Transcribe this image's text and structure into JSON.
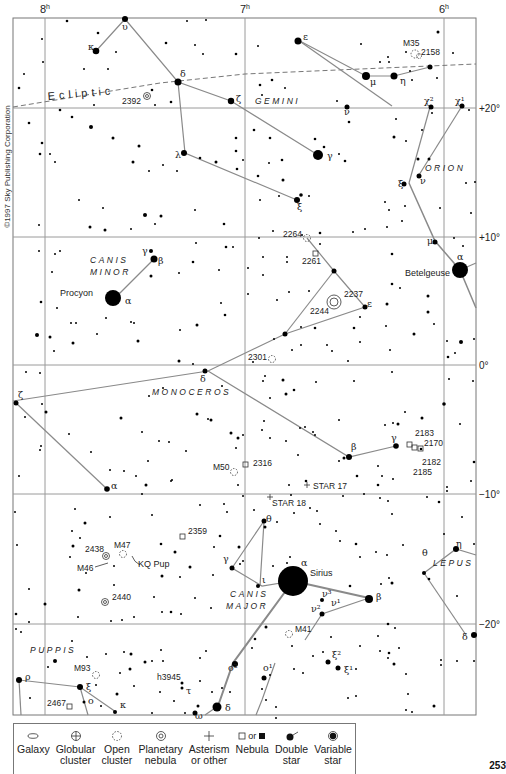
{
  "copyright": "©1997 Sky Publishing Corporation",
  "page_number": "253",
  "ra_labels": [
    {
      "label": "8",
      "sup": "h",
      "x": 45
    },
    {
      "label": "7",
      "sup": "h",
      "x": 245
    },
    {
      "label": "6",
      "sup": "h",
      "x": 444
    }
  ],
  "dec_labels": [
    {
      "label": "+20°",
      "y": 108
    },
    {
      "label": "+10°",
      "y": 237
    },
    {
      "label": "0°",
      "y": 365
    },
    {
      "label": "−10°",
      "y": 494
    },
    {
      "label": "−20°",
      "y": 624
    }
  ],
  "ecliptic_label": "Ecliptic",
  "constellations": [
    {
      "name": "GEMINI",
      "x": 255,
      "y": 104
    },
    {
      "name": "ORION",
      "x": 425,
      "y": 171
    },
    {
      "name": "CANIS",
      "x": 90,
      "y": 263
    },
    {
      "name": "MINOR",
      "x": 90,
      "y": 275
    },
    {
      "name": "MONOCEROS",
      "x": 152,
      "y": 395
    },
    {
      "name": "LEPUS",
      "x": 433,
      "y": 566
    },
    {
      "name": "CANIS",
      "x": 230,
      "y": 597
    },
    {
      "name": "MAJOR",
      "x": 226,
      "y": 609
    },
    {
      "name": "PUPPIS",
      "x": 30,
      "y": 653
    }
  ],
  "star_names": [
    {
      "name": "Procyon",
      "x": 60,
      "y": 296
    },
    {
      "name": "Betelgeuse",
      "x": 405,
      "y": 276
    },
    {
      "name": "Sirius",
      "x": 310,
      "y": 576
    },
    {
      "name": "KQ Pup",
      "x": 138,
      "y": 567
    }
  ],
  "objects": [
    {
      "label": "M35",
      "x": 403,
      "y": 46
    },
    {
      "label": "2158",
      "x": 421,
      "y": 55
    },
    {
      "label": "2392",
      "x": 122,
      "y": 104
    },
    {
      "label": "2264",
      "x": 283,
      "y": 237
    },
    {
      "label": "2261",
      "x": 302,
      "y": 264
    },
    {
      "label": "2237",
      "x": 344,
      "y": 297
    },
    {
      "label": "2244",
      "x": 310,
      "y": 314
    },
    {
      "label": "2301",
      "x": 248,
      "y": 360
    },
    {
      "label": "2183",
      "x": 415,
      "y": 436
    },
    {
      "label": "2170",
      "x": 424,
      "y": 446
    },
    {
      "label": "2182",
      "x": 422,
      "y": 465
    },
    {
      "label": "2185",
      "x": 413,
      "y": 475
    },
    {
      "label": "M50",
      "x": 213,
      "y": 470
    },
    {
      "label": "2316",
      "x": 253,
      "y": 466
    },
    {
      "label": "STAR 17",
      "x": 313,
      "y": 489
    },
    {
      "label": "STAR 18",
      "x": 272,
      "y": 506
    },
    {
      "label": "2359",
      "x": 188,
      "y": 534
    },
    {
      "label": "2438",
      "x": 85,
      "y": 552
    },
    {
      "label": "M47",
      "x": 114,
      "y": 548
    },
    {
      "label": "M46",
      "x": 77,
      "y": 571
    },
    {
      "label": "2440",
      "x": 112,
      "y": 600
    },
    {
      "label": "M41",
      "x": 295,
      "y": 632
    },
    {
      "label": "M93",
      "x": 74,
      "y": 671
    },
    {
      "label": "h3945",
      "x": 157,
      "y": 680
    },
    {
      "label": "2467",
      "x": 47,
      "y": 706
    }
  ],
  "greek_labels": [
    {
      "t": "υ",
      "x": 122,
      "y": 30
    },
    {
      "t": "κ",
      "x": 88,
      "y": 50
    },
    {
      "t": "ε",
      "x": 303,
      "y": 40
    },
    {
      "t": "δ",
      "x": 180,
      "y": 77
    },
    {
      "t": "ζ",
      "x": 236,
      "y": 102
    },
    {
      "t": "μ",
      "x": 370,
      "y": 85
    },
    {
      "t": "η",
      "x": 400,
      "y": 84
    },
    {
      "t": "ν",
      "x": 344,
      "y": 115
    },
    {
      "t": "χ²",
      "x": 424,
      "y": 104
    },
    {
      "t": "χ¹",
      "x": 455,
      "y": 104
    },
    {
      "t": "γ",
      "x": 327,
      "y": 159
    },
    {
      "t": "λ",
      "x": 175,
      "y": 158
    },
    {
      "t": "ξ",
      "x": 297,
      "y": 210
    },
    {
      "t": "ξ",
      "x": 398,
      "y": 187
    },
    {
      "t": "ν",
      "x": 420,
      "y": 184
    },
    {
      "t": "μ",
      "x": 427,
      "y": 244
    },
    {
      "t": "α",
      "x": 457,
      "y": 260
    },
    {
      "t": "γ",
      "x": 142,
      "y": 254
    },
    {
      "t": "β",
      "x": 158,
      "y": 264
    },
    {
      "t": "α",
      "x": 125,
      "y": 304
    },
    {
      "t": "ε",
      "x": 367,
      "y": 307
    },
    {
      "t": "δ",
      "x": 200,
      "y": 382
    },
    {
      "t": "ζ",
      "x": 18,
      "y": 398
    },
    {
      "t": "β",
      "x": 351,
      "y": 450
    },
    {
      "t": "γ",
      "x": 391,
      "y": 441
    },
    {
      "t": "α",
      "x": 111,
      "y": 489
    },
    {
      "t": "θ",
      "x": 266,
      "y": 522
    },
    {
      "t": "γ",
      "x": 223,
      "y": 562
    },
    {
      "t": "ι",
      "x": 262,
      "y": 583
    },
    {
      "t": "α",
      "x": 301,
      "y": 566
    },
    {
      "t": "β",
      "x": 376,
      "y": 600
    },
    {
      "t": "ν³",
      "x": 322,
      "y": 597
    },
    {
      "t": "ν¹",
      "x": 331,
      "y": 606
    },
    {
      "t": "ν²",
      "x": 311,
      "y": 612
    },
    {
      "t": "θ",
      "x": 422,
      "y": 556
    },
    {
      "t": "η",
      "x": 456,
      "y": 547
    },
    {
      "t": "δ",
      "x": 462,
      "y": 640
    },
    {
      "t": "ξ²",
      "x": 332,
      "y": 658
    },
    {
      "t": "ξ¹",
      "x": 344,
      "y": 673
    },
    {
      "t": "ο²",
      "x": 228,
      "y": 671
    },
    {
      "t": "ο¹",
      "x": 263,
      "y": 671
    },
    {
      "t": "ρ",
      "x": 25,
      "y": 680
    },
    {
      "t": "ξ",
      "x": 86,
      "y": 690
    },
    {
      "t": "ο",
      "x": 88,
      "y": 704
    },
    {
      "t": "κ",
      "x": 120,
      "y": 708
    },
    {
      "t": "τ",
      "x": 186,
      "y": 694
    },
    {
      "t": "δ",
      "x": 225,
      "y": 711
    },
    {
      "t": "ω",
      "x": 195,
      "y": 719
    }
  ],
  "legend": {
    "items": [
      {
        "symbol": "galaxy",
        "line1": "Galaxy",
        "line2": ""
      },
      {
        "symbol": "globular",
        "line1": "Globular",
        "line2": "cluster"
      },
      {
        "symbol": "open",
        "line1": "Open",
        "line2": "cluster"
      },
      {
        "symbol": "planetary",
        "line1": "Planetary",
        "line2": "nebula"
      },
      {
        "symbol": "asterism",
        "line1": "Asterism",
        "line2": "or other"
      },
      {
        "symbol": "nebula",
        "line1": "Nebula",
        "line2": "",
        "or_text": "or"
      },
      {
        "symbol": "double",
        "line1": "Double",
        "line2": "star"
      },
      {
        "symbol": "variable",
        "line1": "Variable",
        "line2": "star"
      }
    ]
  },
  "colors": {
    "grid": "#a0a0a0",
    "lines": "#8a8a8a",
    "stars": "#000000",
    "text": "#222222"
  }
}
